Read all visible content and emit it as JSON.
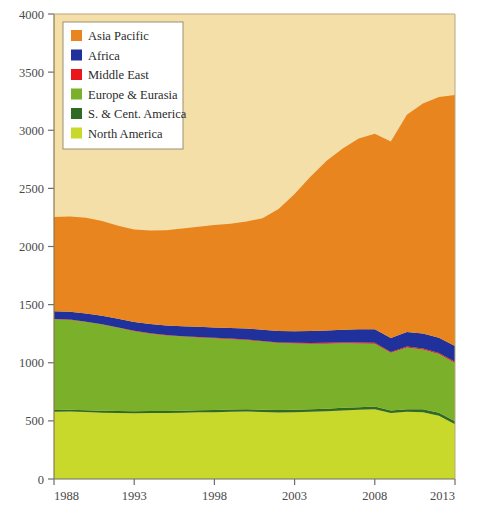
{
  "chart_data": {
    "type": "area",
    "stacked": true,
    "title": "",
    "subtitle": "",
    "xlabel": "",
    "ylabel": "",
    "xlim": [
      1988,
      2013
    ],
    "ylim": [
      0,
      4000
    ],
    "grid": false,
    "legend_position": "top-left",
    "x": [
      1988,
      1989,
      1990,
      1991,
      1992,
      1993,
      1994,
      1995,
      1996,
      1997,
      1998,
      1999,
      2000,
      2001,
      2002,
      2003,
      2004,
      2005,
      2006,
      2007,
      2008,
      2009,
      2010,
      2011,
      2012,
      2013
    ],
    "xticks": [
      1988,
      1993,
      1998,
      2003,
      2008,
      2013
    ],
    "yticks": [
      0,
      500,
      1000,
      1500,
      2000,
      2500,
      3000,
      3500,
      4000
    ],
    "series": [
      {
        "name": "North America",
        "color": "#c8d92b",
        "values": [
          578,
          580,
          576,
          570,
          568,
          565,
          567,
          568,
          570,
          574,
          575,
          578,
          580,
          576,
          573,
          575,
          578,
          582,
          590,
          595,
          600,
          568,
          578,
          575,
          545,
          470
        ]
      },
      {
        "name": "S. & Cent. America",
        "color": "#2f6b25",
        "values": [
          16,
          16,
          16,
          17,
          17,
          17,
          17,
          18,
          18,
          18,
          19,
          19,
          20,
          20,
          20,
          21,
          21,
          22,
          22,
          23,
          23,
          22,
          23,
          24,
          25,
          26
        ]
      },
      {
        "name": "Europe & Eurasia",
        "color": "#7ab02a",
        "values": [
          780,
          772,
          758,
          742,
          716,
          690,
          666,
          648,
          637,
          626,
          616,
          606,
          596,
          586,
          577,
          570,
          565,
          560,
          555,
          548,
          540,
          495,
          530,
          515,
          505,
          502
        ]
      },
      {
        "name": "Middle East",
        "color": "#e8171c",
        "values": [
          3,
          3,
          3,
          3,
          3,
          3,
          4,
          4,
          4,
          4,
          4,
          5,
          5,
          5,
          5,
          6,
          6,
          7,
          7,
          8,
          8,
          8,
          9,
          9,
          9,
          10
        ]
      },
      {
        "name": "Africa",
        "color": "#21319b",
        "values": [
          66,
          68,
          70,
          72,
          74,
          76,
          79,
          82,
          85,
          88,
          90,
          92,
          94,
          96,
          98,
          100,
          103,
          107,
          110,
          114,
          118,
          120,
          124,
          128,
          132,
          136
        ]
      },
      {
        "name": "Asia Pacific",
        "color": "#e8851f",
        "values": [
          810,
          820,
          825,
          815,
          800,
          795,
          805,
          820,
          840,
          860,
          880,
          895,
          920,
          960,
          1050,
          1180,
          1330,
          1460,
          1560,
          1640,
          1680,
          1690,
          1870,
          1980,
          2070,
          2160
        ]
      }
    ],
    "legend": [
      {
        "label": "Asia Pacific",
        "color": "#e8851f"
      },
      {
        "label": "Africa",
        "color": "#21319b"
      },
      {
        "label": "Middle East",
        "color": "#e8171c"
      },
      {
        "label": "Europe & Eurasia",
        "color": "#7ab02a"
      },
      {
        "label": "S. & Cent. America",
        "color": "#2f6b25"
      },
      {
        "label": "North America",
        "color": "#c8d92b"
      }
    ],
    "background_color": "#f5dfa8",
    "plot_border_color": "#8a7a4a",
    "axis_text_color": "#4a4a4a"
  }
}
